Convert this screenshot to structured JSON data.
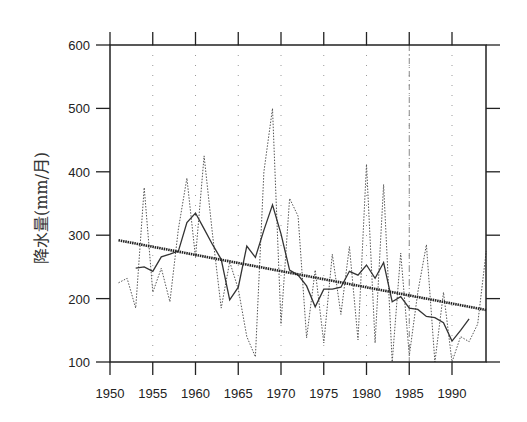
{
  "chart_data": {
    "type": "line",
    "title": "",
    "xlabel": "",
    "ylabel": "降水量(mm/月)",
    "xlim": [
      1950,
      1994
    ],
    "ylim": [
      100,
      600
    ],
    "x_ticks": [
      "1950",
      "1955",
      "1960",
      "1965",
      "1970",
      "1975",
      "1980",
      "1985",
      "1990"
    ],
    "y_ticks": [
      "100",
      "200",
      "300",
      "400",
      "500",
      "600"
    ],
    "grid": "dotted vertical guides at 5-year ticks",
    "legend": null,
    "series": [
      {
        "name": "annual precipitation",
        "style": "dotted",
        "x": [
          1951,
          1952,
          1953,
          1954,
          1955,
          1956,
          1957,
          1958,
          1959,
          1960,
          1961,
          1962,
          1963,
          1964,
          1965,
          1966,
          1967,
          1968,
          1969,
          1970,
          1971,
          1972,
          1973,
          1974,
          1975,
          1976,
          1977,
          1978,
          1979,
          1980,
          1981,
          1982,
          1983,
          1984,
          1985,
          1986,
          1987,
          1988,
          1989,
          1990,
          1991,
          1992,
          1993,
          1994
        ],
        "values": [
          225,
          232,
          185,
          375,
          210,
          248,
          195,
          310,
          390,
          265,
          425,
          300,
          185,
          258,
          215,
          140,
          108,
          400,
          500,
          160,
          358,
          330,
          138,
          245,
          130,
          270,
          175,
          282,
          135,
          412,
          130,
          380,
          100,
          272,
          110,
          210,
          285,
          100,
          210,
          100,
          140,
          132,
          160,
          275
        ]
      },
      {
        "name": "5-year running mean",
        "style": "solid",
        "x": [
          1953,
          1954,
          1955,
          1956,
          1957,
          1958,
          1959,
          1960,
          1961,
          1962,
          1963,
          1964,
          1965,
          1966,
          1967,
          1968,
          1969,
          1970,
          1971,
          1972,
          1973,
          1974,
          1975,
          1976,
          1977,
          1978,
          1979,
          1980,
          1981,
          1982,
          1983,
          1984,
          1985,
          1986,
          1987,
          1988,
          1989,
          1990,
          1991,
          1992
        ],
        "values": [
          248,
          250,
          243,
          266,
          270,
          275,
          320,
          335,
          310,
          285,
          262,
          198,
          218,
          283,
          265,
          308,
          348,
          302,
          245,
          237,
          220,
          187,
          215,
          215,
          218,
          243,
          237,
          253,
          232,
          257,
          195,
          203,
          185,
          183,
          172,
          170,
          162,
          133,
          150,
          168
        ]
      },
      {
        "name": "linear trend",
        "style": "thick dotted",
        "x": [
          1951,
          1994
        ],
        "values": [
          292,
          182
        ]
      }
    ]
  },
  "axis": {
    "ylabel": "降水量(mm/月)"
  }
}
